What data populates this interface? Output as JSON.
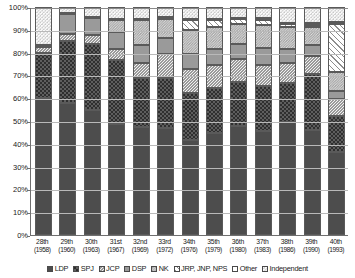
{
  "chart_data": {
    "type": "bar",
    "stacked": true,
    "stacked_mode": "percent",
    "title": "",
    "subtitle": "",
    "xlabel": "",
    "ylabel": "",
    "ylim": [
      0,
      100
    ],
    "ytick_labels": [
      "100%",
      "90%",
      "80%",
      "70%",
      "60%",
      "50%",
      "40%",
      "30%",
      "20%",
      "10%",
      "0%"
    ],
    "ytick_values": [
      100,
      90,
      80,
      70,
      60,
      50,
      40,
      30,
      20,
      10,
      0
    ],
    "grid": true,
    "legend_position": "bottom",
    "categories": [
      "28th (1958)",
      "29th (1960)",
      "30th (1963)",
      "31st (1967)",
      "32nd (1969)",
      "33rd (1972)",
      "34th (1976)",
      "35th (1979)",
      "36th (1980)",
      "37th (1983)",
      "38th (1986)",
      "39th (1990)",
      "40th (1993)"
    ],
    "category_labels": [
      {
        "line1": "28th",
        "line2": "(1958)"
      },
      {
        "line1": "29th",
        "line2": "(1960)"
      },
      {
        "line1": "30th",
        "line2": "(1963)"
      },
      {
        "line1": "31st",
        "line2": "(1967)"
      },
      {
        "line1": "32nd",
        "line2": "(1969)"
      },
      {
        "line1": "33rd",
        "line2": "(1972)"
      },
      {
        "line1": "34th",
        "line2": "(1976)"
      },
      {
        "line1": "35th",
        "line2": "(1979)"
      },
      {
        "line1": "36th",
        "line2": "(1980)"
      },
      {
        "line1": "37th",
        "line2": "(1983)"
      },
      {
        "line1": "38th",
        "line2": "(1986)"
      },
      {
        "line1": "39th",
        "line2": "(1990)"
      },
      {
        "line1": "40th",
        "line2": "(1993)"
      }
    ],
    "series": [
      {
        "name": "LDP",
        "key": "ldp",
        "pattern": "solid-dark",
        "color": "#4d4d4d",
        "values": [
          59.8,
          57.8,
          54.8,
          48.9,
          47.3,
          46.9,
          41.8,
          44.6,
          47.9,
          45.8,
          49.4,
          46.1,
          36.6
        ]
      },
      {
        "name": "SPJ",
        "key": "spj",
        "pattern": "checker-dark",
        "color": "#5e5e5e",
        "values": [
          19.5,
          27.5,
          29.0,
          27.9,
          21.4,
          21.9,
          20.7,
          19.7,
          19.3,
          19.5,
          17.2,
          24.4,
          15.4
        ]
      },
      {
        "name": "JCP",
        "key": "jcp",
        "pattern": "fine-dot-light",
        "color": "#f2f2f2",
        "values": [
          2.6,
          2.9,
          4.0,
          4.8,
          6.8,
          10.5,
          10.4,
          10.4,
          9.8,
          9.3,
          8.8,
          8.0,
          7.7
        ]
      },
      {
        "name": "DSP",
        "key": "dsp",
        "pattern": "solid-mid",
        "color": "#9a9a9a",
        "values": [
          0.0,
          8.8,
          7.4,
          7.4,
          7.7,
          7.0,
          6.3,
          6.8,
          6.6,
          7.3,
          6.4,
          4.8,
          3.5
        ]
      },
      {
        "name": "NK",
        "key": "nk",
        "pattern": "micro-dot",
        "color": "#e2e2e2",
        "values": [
          0.0,
          0.0,
          0.0,
          5.4,
          10.9,
          8.5,
          10.9,
          9.8,
          9.0,
          10.1,
          9.4,
          8.0,
          8.1
        ]
      },
      {
        "name": "JRP, JNP, NPS",
        "key": "jrp",
        "pattern": "diagonal-hatch",
        "color": "#ffffff",
        "values": [
          0.0,
          0.0,
          0.0,
          0.0,
          0.0,
          0.0,
          4.2,
          3.0,
          2.0,
          2.4,
          1.3,
          0.8,
          21.1
        ]
      },
      {
        "name": "Other",
        "key": "other",
        "pattern": "white",
        "color": "#ffffff",
        "values": [
          0.9,
          0.5,
          0.6,
          0.5,
          0.6,
          0.8,
          0.6,
          0.5,
          0.6,
          0.6,
          0.6,
          1.1,
          1.0
        ]
      },
      {
        "name": "Independent",
        "key": "ind",
        "pattern": "sparse-dot",
        "color": "#fafafa",
        "values": [
          16.7,
          2.5,
          4.2,
          5.1,
          5.3,
          4.4,
          5.1,
          5.2,
          4.8,
          5.0,
          6.9,
          6.8,
          6.6
        ]
      }
    ]
  },
  "legend": {
    "items": [
      {
        "label": "LDP",
        "swatch": "p-ldp"
      },
      {
        "label": "SPJ",
        "swatch": "p-spj"
      },
      {
        "label": "JCP",
        "swatch": "p-jcp"
      },
      {
        "label": "DSP",
        "swatch": "p-dsp"
      },
      {
        "label": "NK",
        "swatch": "p-nk"
      },
      {
        "label": "JRP, JNP, NPS",
        "swatch": "p-jrp"
      },
      {
        "label": "Other",
        "swatch": "p-other"
      },
      {
        "label": "Independent",
        "swatch": "p-ind"
      }
    ]
  }
}
